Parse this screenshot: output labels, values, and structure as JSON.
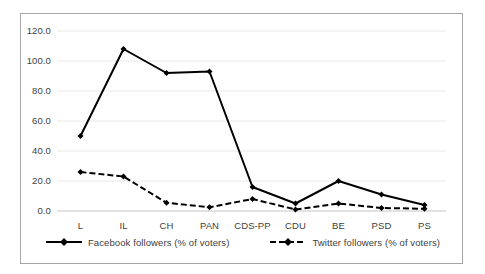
{
  "chart_data": {
    "type": "line",
    "title": "",
    "xlabel": "",
    "ylabel": "",
    "categories": [
      "L",
      "IL",
      "CH",
      "PAN",
      "CDS-PP",
      "CDU",
      "BE",
      "PSD",
      "PS"
    ],
    "series": [
      {
        "name": "Facebook followers (% of voters)",
        "values": [
          50,
          108,
          92,
          93,
          16,
          5,
          20,
          11,
          4
        ],
        "line_style": "solid",
        "marker": "diamond",
        "color": "#000000"
      },
      {
        "name": "Twitter followers (% of voters)",
        "values": [
          26,
          23,
          5.5,
          2.5,
          8,
          1,
          5,
          2,
          1.5
        ],
        "line_style": "dashed",
        "marker": "diamond",
        "color": "#000000"
      }
    ],
    "ylim": [
      0,
      120
    ],
    "ytick_labels": [
      "0.0",
      "20.0",
      "40.0",
      "60.0",
      "80.0",
      "100.0",
      "120.0"
    ],
    "ytick_values": [
      0,
      20,
      40,
      60,
      80,
      100,
      120
    ],
    "grid": "horizontal",
    "grid_color": "#e8e8e8",
    "legend_position": "bottom",
    "plot_background": "#ffffff",
    "border_color": "#a6a6a6"
  }
}
